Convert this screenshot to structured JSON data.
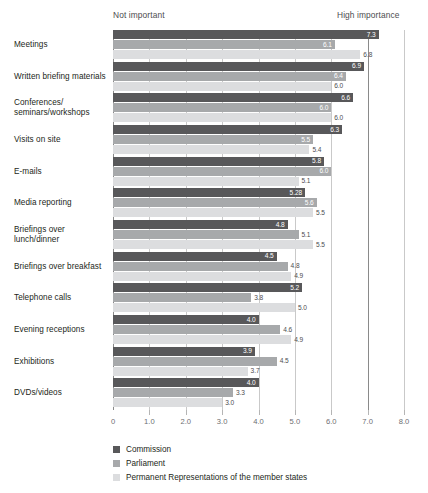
{
  "headers": {
    "left": "Not important",
    "right": "High importance"
  },
  "legend": {
    "items": [
      {
        "label": "Commission",
        "color": "#58585a"
      },
      {
        "label": "Parliament",
        "color": "#a7a9ab"
      },
      {
        "label": "Permanent Representations of the member states",
        "color": "#dcdddf"
      }
    ]
  },
  "chart_data": {
    "type": "bar",
    "orientation": "horizontal",
    "title": "",
    "xlabel": "",
    "ylabel": "",
    "xlim": [
      0,
      8.0
    ],
    "grid": true,
    "legend_position": "bottom-left",
    "tick_labels": [
      "0",
      "1.0",
      "2.0",
      "3.0",
      "4.0",
      "5.0",
      "6.0",
      "7.0",
      "8.0"
    ],
    "ticks": [
      0,
      1,
      2,
      3,
      4,
      5,
      6,
      7,
      8
    ],
    "axis_annotations": {
      "low_end": "Not important",
      "high_end": "High importance"
    },
    "categories": [
      "Meetings",
      "Written briefing materials",
      "Conferences/\nseminars/workshops",
      "Visits on site",
      "E-mails",
      "Media reporting",
      "Briefings over\nlunch/dinner",
      "Briefings over breakfast",
      "Telephone calls",
      "Evening receptions",
      "Exhibitions",
      "DVDs/videos"
    ],
    "series": [
      {
        "name": "Commission",
        "color": "#58585a",
        "values": [
          7.3,
          6.9,
          6.6,
          6.3,
          5.8,
          5.28,
          4.8,
          4.5,
          5.2,
          4.0,
          3.9,
          4.0
        ],
        "labels": [
          "7.3",
          "6.9",
          "6.6",
          "6.3",
          "5.8",
          "5.28",
          "4.8",
          "4.5",
          "5.2",
          "4.0",
          "3.9",
          "4.0"
        ]
      },
      {
        "name": "Parliament",
        "color": "#a7a9ab",
        "values": [
          6.1,
          6.4,
          6.0,
          5.5,
          6.0,
          5.6,
          5.1,
          4.8,
          3.8,
          4.6,
          4.5,
          3.3
        ],
        "labels": [
          "6.1",
          "6.4",
          "6.0",
          "5.5",
          "6.0",
          "5.6",
          "5.1",
          "4.8",
          "3.8",
          "4.6",
          "4.5",
          "3.3"
        ]
      },
      {
        "name": "Permanent Representations of the member states",
        "color": "#dcdddf",
        "values": [
          6.8,
          6.0,
          6.0,
          5.4,
          5.1,
          5.5,
          5.5,
          4.9,
          5.0,
          4.9,
          3.7,
          3.0
        ],
        "labels": [
          "6.8",
          "6.0",
          "6.0",
          "5.4",
          "5.1",
          "5.5",
          "5.5",
          "4.9",
          "5.0",
          "4.9",
          "3.7",
          "3.0"
        ]
      }
    ]
  }
}
